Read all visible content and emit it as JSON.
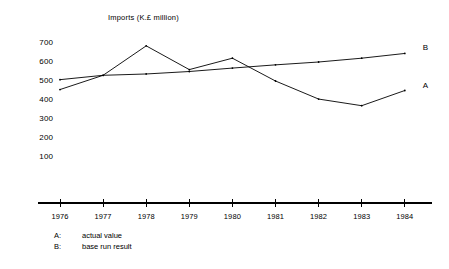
{
  "chart_data": {
    "type": "line",
    "title": "Imports  (K.£ million)",
    "xlabel": "",
    "ylabel": "",
    "categories": [
      "1976",
      "1977",
      "1978",
      "1979",
      "1980",
      "1981",
      "1982",
      "1983",
      "1984"
    ],
    "x": [
      1976,
      1977,
      1978,
      1979,
      1980,
      1981,
      1982,
      1983,
      1984
    ],
    "ylim": [
      0,
      700
    ],
    "xlim": [
      1976,
      1984
    ],
    "yticks": [
      100,
      200,
      300,
      400,
      500,
      600,
      700
    ],
    "ytick_labels": [
      "100",
      "200",
      "300",
      "400",
      "500",
      "600",
      "700"
    ],
    "grid": false,
    "legend_position": "below-left",
    "series": [
      {
        "name": "A",
        "label": "actual value",
        "values": [
          455,
          530,
          685,
          560,
          620,
          500,
          405,
          370,
          450
        ]
      },
      {
        "name": "B",
        "label": "base run result",
        "values": [
          507,
          530,
          537,
          550,
          568,
          585,
          600,
          620,
          645
        ]
      }
    ],
    "annotations": [
      {
        "text": "B",
        "series": "B",
        "position": "right-end"
      },
      {
        "text": "A",
        "series": "A",
        "position": "right-end"
      }
    ]
  },
  "legend": {
    "rows": [
      {
        "key": "A:",
        "desc": "actual value"
      },
      {
        "key": "B:",
        "desc": "base run result"
      }
    ]
  }
}
